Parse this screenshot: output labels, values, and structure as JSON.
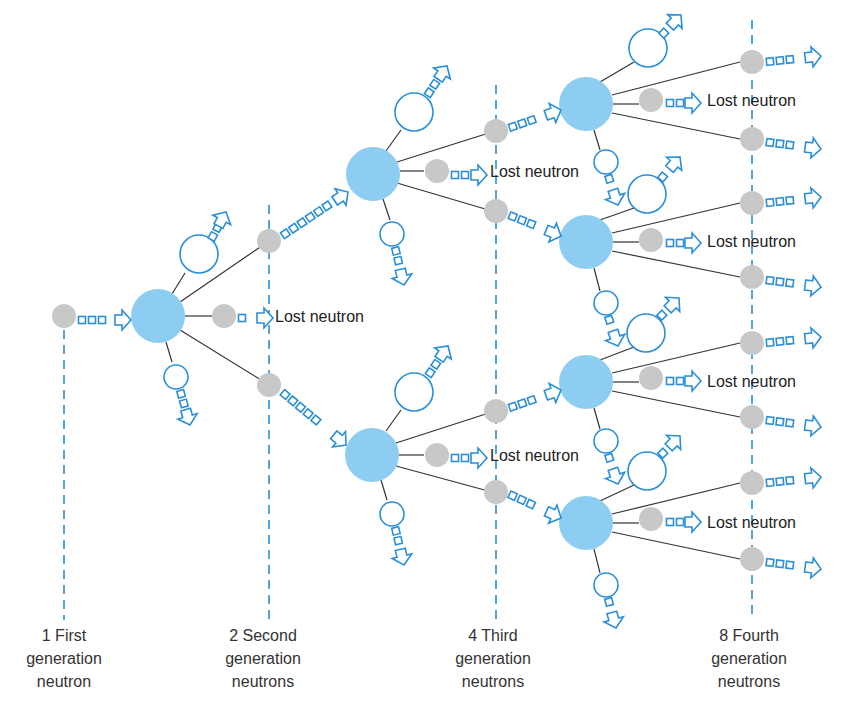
{
  "colors": {
    "nucleus": "#8ecdf2",
    "fragment_outline": "#2a8fd6",
    "neutron": "#c8c8c8",
    "arrow": "#2a8fd6",
    "line": "#333333",
    "dashed": "#2a8fd6",
    "text": "#222222"
  },
  "lost_neutron_label": "Lost neutron",
  "generations": [
    {
      "line1": "1 First",
      "line2": "generation",
      "line3": "neutron"
    },
    {
      "line1": "2 Second",
      "line2": "generation",
      "line3": "neutrons"
    },
    {
      "line1": "4 Third",
      "line2": "generation",
      "line3": "neutrons"
    },
    {
      "line1": "8 Fourth",
      "line2": "generation",
      "line3": "neutrons"
    }
  ],
  "lost_labels": [
    {
      "text": "Lost neutron"
    },
    {
      "text": "Lost neutron"
    },
    {
      "text": "Lost neutron"
    },
    {
      "text": "Lost neutron"
    },
    {
      "text": "Lost neutron"
    },
    {
      "text": "Lost neutron"
    },
    {
      "text": "Lost neutron"
    }
  ]
}
